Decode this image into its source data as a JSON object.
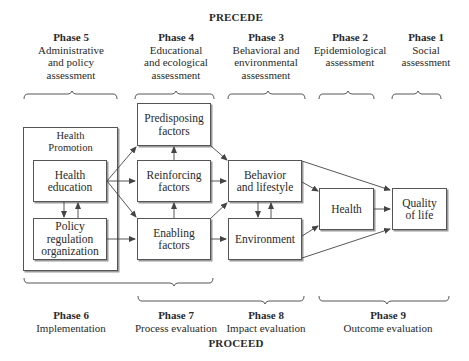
{
  "diagram": {
    "top_title": "PRECEDE",
    "bottom_title": "PROCEED",
    "precede_phases": [
      {
        "phase": "Phase 5",
        "description": "Administrative\nand policy\nassessment"
      },
      {
        "phase": "Phase 4",
        "description": "Educational\nand ecological\nassessment"
      },
      {
        "phase": "Phase 3",
        "description": "Behavioral and\nenvironmental\nassessment"
      },
      {
        "phase": "Phase 2",
        "description": "Epidemiological\nassessment"
      },
      {
        "phase": "Phase 1",
        "description": "Social\nassessment"
      }
    ],
    "proceed_phases": [
      {
        "phase": "Phase 6",
        "description": "Implementation"
      },
      {
        "phase": "Phase 7",
        "description": "Process evaluation"
      },
      {
        "phase": "Phase 8",
        "description": "Impact evaluation"
      },
      {
        "phase": "Phase 9",
        "description": "Outcome evaluation"
      }
    ],
    "health_promotion": {
      "label": "Health\nPromotion",
      "health_education": "Health\neducation",
      "policy": "Policy\nregulation\norganization"
    },
    "factors": {
      "predisposing": "Predisposing\nfactors",
      "reinforcing": "Reinforcing\nfactors",
      "enabling": "Enabling\nfactors"
    },
    "behavior": "Behavior\nand lifestyle",
    "environment": "Environment",
    "health": "Health",
    "quality_of_life": "Quality\nof life",
    "colors": {
      "line": "#444444",
      "box_border": "#555555",
      "shadow": "#9a9a9a",
      "text": "#2a2a2a"
    }
  }
}
